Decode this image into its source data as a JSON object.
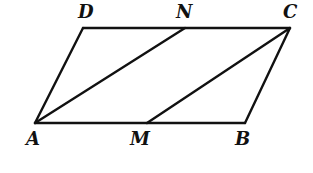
{
  "figure": {
    "type": "parallelogram-diagram",
    "stroke_color": "#111111",
    "points": {
      "A": {
        "label": "A",
        "x": 35,
        "y": 123
      },
      "B": {
        "label": "B",
        "x": 245,
        "y": 123
      },
      "C": {
        "label": "C",
        "x": 290,
        "y": 28
      },
      "D": {
        "label": "D",
        "x": 83,
        "y": 28
      },
      "M": {
        "label": "M",
        "x": 147,
        "y": 123
      },
      "N": {
        "label": "N",
        "x": 185,
        "y": 28
      }
    },
    "segments": [
      [
        "A",
        "B"
      ],
      [
        "B",
        "C"
      ],
      [
        "C",
        "D"
      ],
      [
        "D",
        "A"
      ],
      [
        "A",
        "N"
      ],
      [
        "M",
        "C"
      ]
    ]
  }
}
